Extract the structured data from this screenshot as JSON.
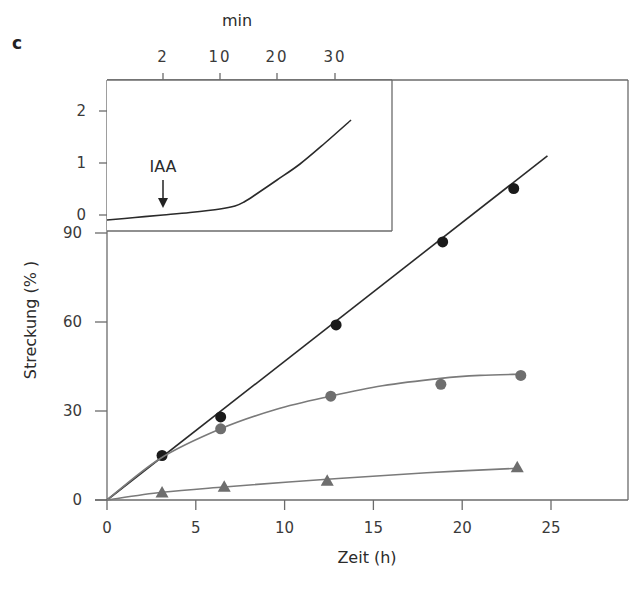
{
  "panel_label": "c",
  "chart_data": [
    {
      "type": "scatter",
      "role": "main",
      "title": "",
      "xlabel": "Zeit (h)",
      "ylabel": "Streckung (% )",
      "xlim": [
        0,
        27.5
      ],
      "ylim": [
        0,
        95
      ],
      "x_ticks": [
        0,
        5,
        10,
        15,
        20,
        25
      ],
      "y_ticks": [
        0,
        30,
        60,
        90
      ],
      "grid": false,
      "legend": null,
      "series": [
        {
          "name": "black-circles",
          "marker": "circle",
          "color": "#1a1a1a",
          "line_color": "#2a2a2a",
          "x": [
            3.1,
            6.4,
            12.9,
            18.9,
            22.9
          ],
          "y": [
            15,
            28,
            59,
            87,
            105
          ],
          "fit": "linear",
          "fit_end": [
            24.8,
            116
          ]
        },
        {
          "name": "gray-circles",
          "marker": "circle",
          "color": "#6e6e6e",
          "line_color": "#7a7a7a",
          "x": [
            6.4,
            12.6,
            18.8,
            23.3
          ],
          "y": [
            24,
            35,
            39,
            42
          ],
          "fit": "saturating",
          "fit_curve": [
            [
              0,
              0
            ],
            [
              3,
              14
            ],
            [
              6.4,
              24
            ],
            [
              9.5,
              30.5
            ],
            [
              12.6,
              35
            ],
            [
              15.5,
              38.5
            ],
            [
              18.8,
              41
            ],
            [
              21,
              42
            ],
            [
              23.3,
              42.4
            ]
          ]
        },
        {
          "name": "gray-triangles",
          "marker": "triangle",
          "color": "#6e6e6e",
          "line_color": "#7a7a7a",
          "x": [
            3.1,
            6.6,
            12.4,
            23.1
          ],
          "y": [
            2.5,
            4.5,
            6.5,
            11
          ],
          "fit": "saturating",
          "fit_curve": [
            [
              0,
              0
            ],
            [
              3.1,
              2.6
            ],
            [
              6.6,
              4.4
            ],
            [
              12.4,
              7.0
            ],
            [
              18,
              9.2
            ],
            [
              23.1,
              10.7
            ]
          ]
        }
      ]
    },
    {
      "type": "line",
      "role": "inset",
      "title": "",
      "xlabel": "min",
      "ylabel": "",
      "x_ticks": [
        "2",
        "10",
        "20",
        "30"
      ],
      "y_ticks": [
        0,
        1,
        2
      ],
      "grid": false,
      "annotation": {
        "text": "IAA",
        "arrow": "down",
        "at_tick": "2"
      },
      "series": [
        {
          "name": "inset-curve",
          "color": "#2a2a2a",
          "points_px": [
            [
              107,
              220
            ],
            [
              135,
              217.5
            ],
            [
              163,
              215
            ],
            [
              190,
              212.5
            ],
            [
              220,
              209
            ],
            [
              235,
              206
            ],
            [
              244,
              202
            ],
            [
              255,
              195
            ],
            [
              277,
              180
            ],
            [
              300,
              164
            ],
            [
              325,
              143
            ],
            [
              351,
              120
            ]
          ]
        }
      ]
    }
  ]
}
